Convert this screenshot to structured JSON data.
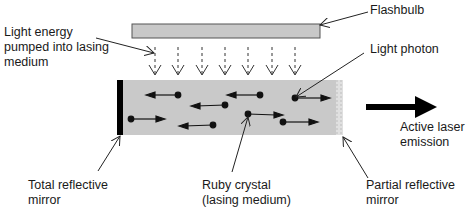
{
  "diagram": {
    "labels": {
      "flashbulb": "Flashbulb",
      "light_energy": "Light energy\npumped into lasing\nmedium",
      "light_photon": "Light photon",
      "active_emission": "Active laser\nemission",
      "total_mirror": "Total reflective\nmirror",
      "ruby_crystal": "Ruby crystal\n(lasing medium)",
      "partial_mirror": "Partial reflective\nmirror"
    },
    "colors": {
      "flashbulb_fill": "#c8c8c8",
      "crystal_fill": "#c9c9c9",
      "mirror_total": "#000000",
      "arrow": "#111111"
    },
    "pump_arrows_count": 7,
    "photons": [
      {
        "x": 178,
        "y": 95,
        "dir": "left"
      },
      {
        "x": 225,
        "y": 105,
        "dir": "left"
      },
      {
        "x": 260,
        "y": 95,
        "dir": "left"
      },
      {
        "x": 295,
        "y": 98,
        "dir": "right"
      },
      {
        "x": 131,
        "y": 119,
        "dir": "right"
      },
      {
        "x": 213,
        "y": 125,
        "dir": "left"
      },
      {
        "x": 248,
        "y": 114,
        "dir": "right"
      },
      {
        "x": 283,
        "y": 122,
        "dir": "right"
      }
    ]
  }
}
